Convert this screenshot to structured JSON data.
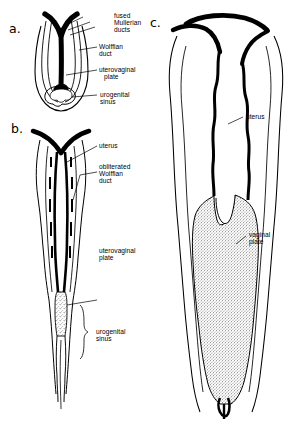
{
  "figure": {
    "background_color": "#ffffff",
    "ink_color": "#000000",
    "panels": [
      {
        "id": "a",
        "letter": "a.",
        "stage": "early fusion of Mullerian ducts with solid uterovaginal plate reaching urogenital sinus",
        "labels": [
          {
            "name": "fused-mullerian-ducts",
            "text": "fused\nMullerian\nducts"
          },
          {
            "name": "wolffian-duct",
            "text": "Wolffian\nduct"
          },
          {
            "name": "uterovaginal-plate",
            "text": "uterovaginal\nplate"
          },
          {
            "name": "urogenital-sinus",
            "text": "urogenital\nsinus"
          }
        ]
      },
      {
        "id": "b",
        "letter": "b.",
        "stage": "uterus formed, Wolffian ducts obliterated, uterovaginal plate expanding into urogenital sinus",
        "labels": [
          {
            "name": "uterus",
            "text": "uterus"
          },
          {
            "name": "obliterated-wolffian-duct",
            "text": "obliterated\nWolffian\nduct"
          },
          {
            "name": "uterovaginal-plate",
            "text": "uterovaginal\nplate"
          },
          {
            "name": "urogenital-sinus",
            "text": "urogenital\nsinus"
          }
        ]
      },
      {
        "id": "c",
        "letter": "c.",
        "stage": "enlarged uterus with extensive solid vaginal plate",
        "labels": [
          {
            "name": "uterus",
            "text": "uterus"
          },
          {
            "name": "vaginal-plate",
            "text": "vaginal\nplate"
          }
        ]
      }
    ]
  },
  "labels": {
    "a_letter": "a.",
    "b_letter": "b.",
    "c_letter": "c.",
    "fused_mullerian_ducts_l1": "fused",
    "fused_mullerian_ducts_l2": "Mullerian",
    "fused_mullerian_ducts_l3": "ducts",
    "wolffian_duct_l1": "Wolffian",
    "wolffian_duct_l2": "duct",
    "uterovaginal_plate_a_l1": "uterovaginal",
    "uterovaginal_plate_a_l2": "plate",
    "urogenital_sinus_a_l1": "urogenital",
    "urogenital_sinus_a_l2": "sinus",
    "uterus_b": "uterus",
    "obliterated_wolffian_duct_l1": "obliterated",
    "obliterated_wolffian_duct_l2": "Wolffian",
    "obliterated_wolffian_duct_l3": "duct",
    "uterovaginal_plate_b_l1": "uterovaginal",
    "uterovaginal_plate_b_l2": "plate",
    "urogenital_sinus_b_l1": "urogenital",
    "urogenital_sinus_b_l2": "sinus",
    "uterus_c": "uterus",
    "vaginal_plate_l1": "vaginal",
    "vaginal_plate_l2": "plate"
  }
}
